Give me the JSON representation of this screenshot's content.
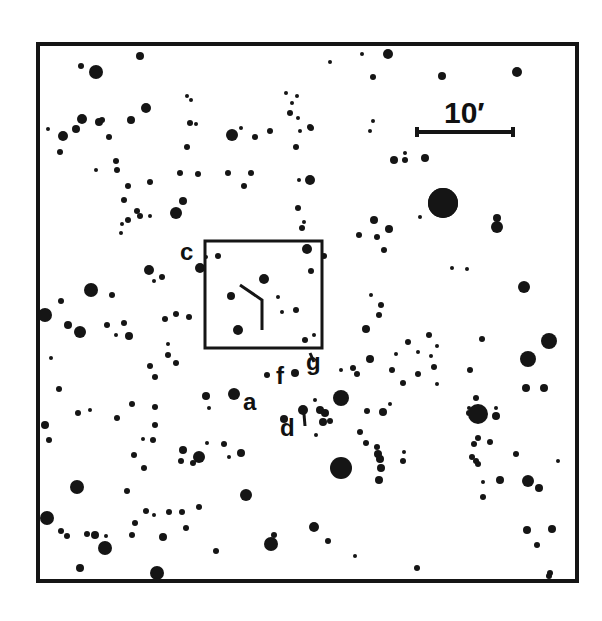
{
  "figure": {
    "type": "finding-chart",
    "frame": {
      "x": 38,
      "y": 44,
      "width": 539,
      "height": 537,
      "stroke": "#111111"
    },
    "scale_bar": {
      "label": "10′",
      "x1": 417,
      "x2": 513,
      "y": 132
    },
    "inset_box": {
      "x": 205,
      "y": 241,
      "width": 117,
      "height": 107
    },
    "labels": [
      {
        "text": "c",
        "x": 180,
        "y": 240,
        "size": 24
      },
      {
        "text": "f",
        "x": 276,
        "y": 364,
        "size": 24
      },
      {
        "text": "g",
        "x": 306,
        "y": 350,
        "size": 24
      },
      {
        "text": "a",
        "x": 243,
        "y": 390,
        "size": 24
      },
      {
        "text": "d",
        "x": 280,
        "y": 416,
        "size": 24
      }
    ],
    "markers": [
      {
        "name": "pointer-line",
        "points": [
          [
            240,
            285
          ],
          [
            262,
            300
          ],
          [
            262,
            330
          ]
        ]
      },
      {
        "name": "d-tick",
        "points": [
          [
            304,
            414
          ],
          [
            305,
            426
          ]
        ]
      },
      {
        "name": "g-tick",
        "points": [
          [
            310,
            353
          ],
          [
            314,
            362
          ]
        ]
      }
    ],
    "stars": [
      [
        96,
        72,
        7
      ],
      [
        140,
        56,
        4
      ],
      [
        81,
        66,
        3
      ],
      [
        388,
        54,
        5
      ],
      [
        362,
        54,
        2
      ],
      [
        330,
        62,
        2
      ],
      [
        442,
        76,
        4
      ],
      [
        517,
        72,
        5
      ],
      [
        373,
        77,
        3
      ],
      [
        63,
        136,
        5
      ],
      [
        76,
        129,
        4
      ],
      [
        82,
        119,
        5
      ],
      [
        99,
        122,
        4
      ],
      [
        146,
        108,
        5
      ],
      [
        131,
        120,
        4
      ],
      [
        102,
        120,
        3
      ],
      [
        48,
        129,
        2
      ],
      [
        60,
        152,
        3
      ],
      [
        109,
        137,
        3
      ],
      [
        116,
        161,
        3
      ],
      [
        117,
        170,
        3
      ],
      [
        96,
        170,
        2
      ],
      [
        128,
        186,
        3
      ],
      [
        150,
        182,
        3
      ],
      [
        176,
        213,
        6
      ],
      [
        183,
        201,
        4
      ],
      [
        124,
        200,
        3
      ],
      [
        137,
        211,
        3
      ],
      [
        150,
        216,
        2
      ],
      [
        128,
        220,
        3
      ],
      [
        122,
        224,
        2
      ],
      [
        121,
        233,
        2
      ],
      [
        140,
        216,
        3
      ],
      [
        187,
        96,
        2
      ],
      [
        191,
        100,
        2
      ],
      [
        190,
        123,
        3
      ],
      [
        196,
        124,
        2
      ],
      [
        187,
        147,
        3
      ],
      [
        180,
        173,
        3
      ],
      [
        198,
        174,
        3
      ],
      [
        232,
        135,
        6
      ],
      [
        241,
        128,
        2
      ],
      [
        255,
        137,
        3
      ],
      [
        270,
        131,
        3
      ],
      [
        286,
        93,
        2
      ],
      [
        290,
        113,
        3
      ],
      [
        292,
        103,
        2
      ],
      [
        297,
        96,
        2
      ],
      [
        310,
        127,
        3
      ],
      [
        296,
        147,
        3
      ],
      [
        251,
        173,
        3
      ],
      [
        244,
        186,
        3
      ],
      [
        299,
        180,
        2
      ],
      [
        310,
        180,
        5
      ],
      [
        298,
        208,
        3
      ],
      [
        302,
        228,
        3
      ],
      [
        304,
        222,
        2
      ],
      [
        228,
        173,
        3
      ],
      [
        300,
        131,
        2
      ],
      [
        311,
        128,
        3
      ],
      [
        298,
        118,
        2
      ],
      [
        373,
        121,
        2
      ],
      [
        370,
        131,
        2
      ],
      [
        394,
        160,
        4
      ],
      [
        405,
        160,
        3
      ],
      [
        405,
        153,
        2
      ],
      [
        425,
        158,
        4
      ],
      [
        443,
        203,
        15
      ],
      [
        497,
        218,
        4
      ],
      [
        497,
        227,
        6
      ],
      [
        374,
        220,
        4
      ],
      [
        389,
        229,
        4
      ],
      [
        377,
        237,
        3
      ],
      [
        384,
        250,
        3
      ],
      [
        420,
        217,
        2
      ],
      [
        443,
        203,
        15
      ],
      [
        200,
        268,
        5
      ],
      [
        206,
        257,
        2
      ],
      [
        218,
        256,
        3
      ],
      [
        307,
        249,
        5
      ],
      [
        311,
        271,
        3
      ],
      [
        264,
        279,
        5
      ],
      [
        231,
        296,
        4
      ],
      [
        238,
        330,
        5
      ],
      [
        278,
        297,
        2
      ],
      [
        282,
        312,
        2
      ],
      [
        296,
        310,
        3
      ],
      [
        314,
        335,
        2
      ],
      [
        305,
        340,
        3
      ],
      [
        149,
        270,
        5
      ],
      [
        162,
        277,
        3
      ],
      [
        154,
        281,
        2
      ],
      [
        91,
        290,
        7
      ],
      [
        112,
        295,
        3
      ],
      [
        61,
        301,
        3
      ],
      [
        45,
        315,
        7
      ],
      [
        68,
        325,
        4
      ],
      [
        80,
        332,
        6
      ],
      [
        107,
        325,
        3
      ],
      [
        124,
        323,
        3
      ],
      [
        116,
        335,
        2
      ],
      [
        129,
        336,
        4
      ],
      [
        165,
        319,
        3
      ],
      [
        176,
        314,
        3
      ],
      [
        168,
        344,
        2
      ],
      [
        168,
        355,
        3
      ],
      [
        176,
        363,
        3
      ],
      [
        150,
        366,
        3
      ],
      [
        51,
        358,
        2
      ],
      [
        59,
        389,
        3
      ],
      [
        132,
        404,
        3
      ],
      [
        155,
        377,
        3
      ],
      [
        189,
        317,
        3
      ],
      [
        324,
        256,
        3
      ],
      [
        371,
        295,
        2
      ],
      [
        381,
        305,
        3
      ],
      [
        379,
        315,
        3
      ],
      [
        366,
        329,
        4
      ],
      [
        359,
        235,
        3
      ],
      [
        452,
        268,
        2
      ],
      [
        467,
        269,
        2
      ],
      [
        524,
        287,
        6
      ],
      [
        549,
        341,
        8
      ],
      [
        528,
        359,
        8
      ],
      [
        544,
        388,
        4
      ],
      [
        482,
        339,
        3
      ],
      [
        526,
        388,
        4
      ],
      [
        408,
        342,
        3
      ],
      [
        429,
        335,
        3
      ],
      [
        437,
        346,
        2
      ],
      [
        431,
        356,
        2
      ],
      [
        418,
        352,
        2
      ],
      [
        418,
        374,
        3
      ],
      [
        434,
        367,
        3
      ],
      [
        437,
        384,
        2
      ],
      [
        470,
        370,
        3
      ],
      [
        469,
        408,
        2
      ],
      [
        469,
        413,
        3
      ],
      [
        476,
        398,
        3
      ],
      [
        478,
        438,
        3
      ],
      [
        496,
        408,
        2
      ],
      [
        490,
        442,
        3
      ],
      [
        396,
        354,
        2
      ],
      [
        392,
        370,
        3
      ],
      [
        403,
        383,
        3
      ],
      [
        357,
        374,
        3
      ],
      [
        353,
        368,
        3
      ],
      [
        370,
        359,
        4
      ],
      [
        341,
        370,
        2
      ],
      [
        478,
        414,
        10
      ],
      [
        496,
        416,
        4
      ],
      [
        206,
        396,
        4
      ],
      [
        209,
        408,
        2
      ],
      [
        234,
        394,
        6
      ],
      [
        295,
        373,
        4
      ],
      [
        267,
        375,
        3
      ],
      [
        341,
        398,
        8
      ],
      [
        315,
        400,
        2
      ],
      [
        320,
        410,
        4
      ],
      [
        303,
        410,
        5
      ],
      [
        325,
        413,
        4
      ],
      [
        330,
        421,
        3
      ],
      [
        323,
        422,
        4
      ],
      [
        284,
        419,
        4
      ],
      [
        360,
        432,
        3
      ],
      [
        316,
        435,
        2
      ],
      [
        366,
        443,
        3
      ],
      [
        367,
        411,
        3
      ],
      [
        383,
        412,
        4
      ],
      [
        390,
        404,
        2
      ],
      [
        45,
        425,
        4
      ],
      [
        49,
        440,
        3
      ],
      [
        78,
        413,
        3
      ],
      [
        90,
        410,
        2
      ],
      [
        155,
        407,
        3
      ],
      [
        155,
        425,
        3
      ],
      [
        153,
        440,
        3
      ],
      [
        143,
        439,
        2
      ],
      [
        117,
        418,
        3
      ],
      [
        144,
        468,
        3
      ],
      [
        183,
        450,
        4
      ],
      [
        181,
        461,
        3
      ],
      [
        199,
        457,
        6
      ],
      [
        193,
        463,
        3
      ],
      [
        229,
        457,
        2
      ],
      [
        241,
        453,
        4
      ],
      [
        207,
        443,
        2
      ],
      [
        224,
        444,
        3
      ],
      [
        77,
        487,
        7
      ],
      [
        134,
        455,
        3
      ],
      [
        127,
        491,
        3
      ],
      [
        341,
        468,
        11
      ],
      [
        377,
        447,
        3
      ],
      [
        378,
        454,
        4
      ],
      [
        380,
        459,
        4
      ],
      [
        381,
        468,
        4
      ],
      [
        379,
        480,
        4
      ],
      [
        404,
        452,
        2
      ],
      [
        403,
        461,
        3
      ],
      [
        474,
        444,
        3
      ],
      [
        472,
        457,
        3
      ],
      [
        478,
        464,
        3
      ],
      [
        476,
        461,
        3
      ],
      [
        483,
        482,
        2
      ],
      [
        483,
        497,
        3
      ],
      [
        500,
        480,
        4
      ],
      [
        528,
        481,
        6
      ],
      [
        539,
        488,
        4
      ],
      [
        558,
        461,
        2
      ],
      [
        516,
        454,
        3
      ],
      [
        246,
        495,
        6
      ],
      [
        146,
        511,
        3
      ],
      [
        169,
        512,
        3
      ],
      [
        154,
        515,
        2
      ],
      [
        182,
        512,
        3
      ],
      [
        199,
        507,
        3
      ],
      [
        186,
        528,
        3
      ],
      [
        47,
        518,
        7
      ],
      [
        61,
        531,
        3
      ],
      [
        67,
        536,
        3
      ],
      [
        87,
        534,
        3
      ],
      [
        95,
        535,
        4
      ],
      [
        135,
        523,
        3
      ],
      [
        163,
        537,
        4
      ],
      [
        132,
        535,
        3
      ],
      [
        106,
        536,
        2
      ],
      [
        105,
        548,
        7
      ],
      [
        80,
        568,
        4
      ],
      [
        157,
        573,
        7
      ],
      [
        216,
        551,
        3
      ],
      [
        271,
        544,
        7
      ],
      [
        274,
        535,
        3
      ],
      [
        314,
        527,
        5
      ],
      [
        328,
        541,
        3
      ],
      [
        355,
        556,
        2
      ],
      [
        417,
        568,
        3
      ],
      [
        527,
        530,
        4
      ],
      [
        552,
        529,
        4
      ],
      [
        537,
        545,
        3
      ],
      [
        550,
        573,
        3
      ],
      [
        549,
        576,
        3
      ]
    ]
  }
}
